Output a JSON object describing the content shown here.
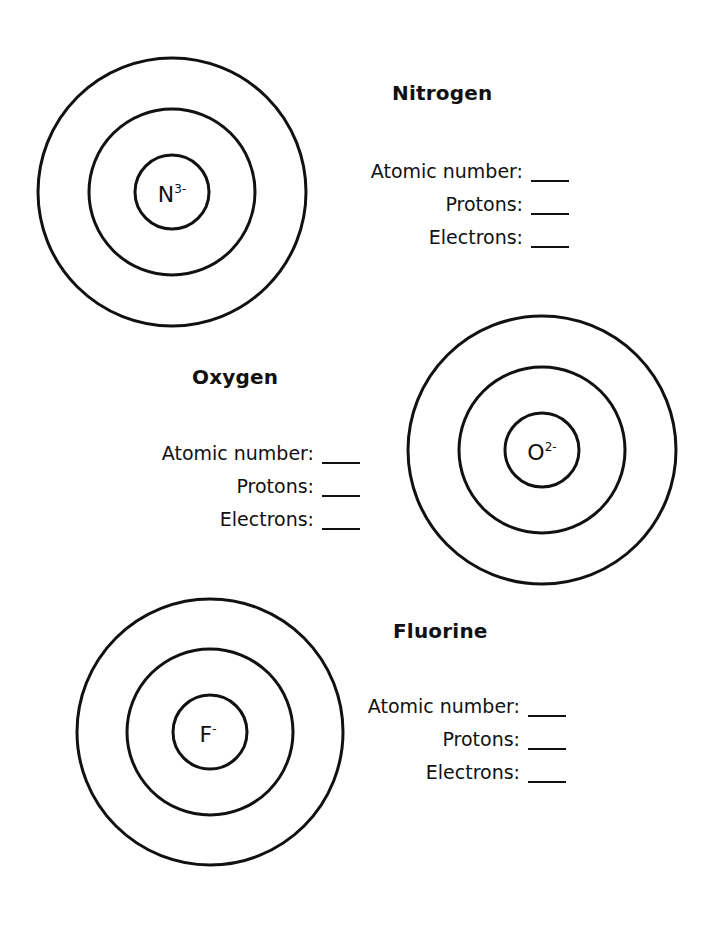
{
  "worksheet": {
    "elements": [
      {
        "name": "Nitrogen",
        "symbol": "N",
        "charge": "3-",
        "fields": {
          "atomic_number_label": "Atomic number:",
          "protons_label": "Protons:",
          "electrons_label": "Electrons:",
          "atomic_number_value": "",
          "protons_value": "",
          "electrons_value": ""
        }
      },
      {
        "name": "Oxygen",
        "symbol": "O",
        "charge": "2-",
        "fields": {
          "atomic_number_label": "Atomic number:",
          "protons_label": "Protons:",
          "electrons_label": "Electrons:",
          "atomic_number_value": "",
          "protons_value": "",
          "electrons_value": ""
        }
      },
      {
        "name": "Fluorine",
        "symbol": "F",
        "charge": "-",
        "fields": {
          "atomic_number_label": "Atomic number:",
          "protons_label": "Protons:",
          "electrons_label": "Electrons:",
          "atomic_number_value": "",
          "protons_value": "",
          "electrons_value": ""
        }
      }
    ],
    "colors": {
      "ink": "#111111",
      "background": "#ffffff"
    }
  }
}
